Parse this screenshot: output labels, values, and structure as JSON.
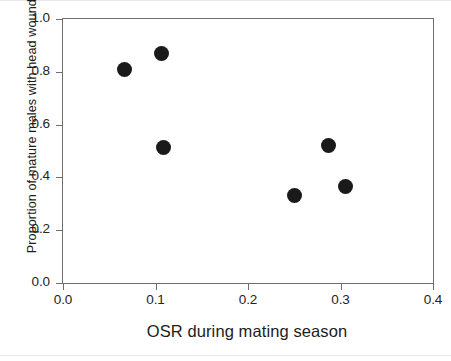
{
  "figure": {
    "background_color": "#ffffff",
    "frame_color": "#6e6e6e",
    "marker_color": "#1a1a1a"
  },
  "chart_data": {
    "type": "scatter",
    "title": "",
    "xlabel": "OSR during mating season",
    "ylabel": "Proportion of mature males with head wounds",
    "xlim": [
      0.0,
      0.4
    ],
    "ylim": [
      0.0,
      1.0
    ],
    "xticks": [
      "0.0",
      "0.1",
      "0.2",
      "0.3",
      "0.4"
    ],
    "yticks": [
      "0.0",
      "0.2",
      "0.4",
      "0.6",
      "0.8",
      "1.0"
    ],
    "xtick_values": [
      0.0,
      0.1,
      0.2,
      0.3,
      0.4
    ],
    "ytick_values": [
      0.0,
      0.2,
      0.4,
      0.6,
      0.8,
      1.0
    ],
    "grid": false,
    "legend": false,
    "legend_position": "none",
    "marker": "filled-circle",
    "series": [
      {
        "name": "populations",
        "points": [
          {
            "x": 0.066,
            "y": 0.81
          },
          {
            "x": 0.107,
            "y": 0.87
          },
          {
            "x": 0.109,
            "y": 0.515
          },
          {
            "x": 0.25,
            "y": 0.33
          },
          {
            "x": 0.287,
            "y": 0.52
          },
          {
            "x": 0.305,
            "y": 0.367
          }
        ]
      }
    ]
  }
}
